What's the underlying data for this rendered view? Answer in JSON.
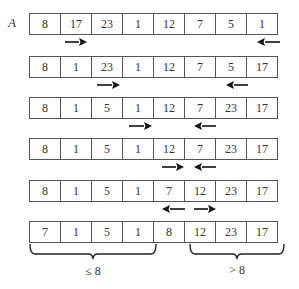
{
  "array_name": "A",
  "steps": [
    {
      "values": [
        "8",
        "17",
        "23",
        "1",
        "12",
        "7",
        "5",
        "1"
      ],
      "arrows": [
        {
          "dir": "right",
          "between": [
            1,
            2
          ]
        },
        {
          "dir": "left",
          "between": [
            7,
            8
          ]
        }
      ]
    },
    {
      "values": [
        "8",
        "1",
        "23",
        "1",
        "12",
        "7",
        "5",
        "17"
      ],
      "arrows": [
        {
          "dir": "right",
          "between": [
            2,
            3
          ]
        },
        {
          "dir": "left",
          "between": [
            6,
            7
          ]
        }
      ]
    },
    {
      "values": [
        "8",
        "1",
        "5",
        "1",
        "12",
        "7",
        "23",
        "17"
      ],
      "arrows": [
        {
          "dir": "right",
          "between": [
            3,
            4
          ]
        },
        {
          "dir": "left",
          "between": [
            5,
            6
          ]
        }
      ]
    },
    {
      "values": [
        "8",
        "1",
        "5",
        "1",
        "12",
        "7",
        "23",
        "17"
      ],
      "arrows": [
        {
          "dir": "right",
          "between": [
            4,
            5
          ]
        },
        {
          "dir": "left",
          "between": [
            5,
            6
          ]
        }
      ]
    },
    {
      "values": [
        "8",
        "1",
        "5",
        "1",
        "7",
        "12",
        "23",
        "17"
      ],
      "arrows": [
        {
          "dir": "left",
          "between": [
            4,
            5
          ]
        },
        {
          "dir": "right",
          "between": [
            5,
            6
          ]
        }
      ]
    },
    {
      "values": [
        "7",
        "1",
        "5",
        "1",
        "8",
        "12",
        "23",
        "17"
      ],
      "arrows": []
    }
  ],
  "partitions": [
    {
      "label": "≤ 8",
      "from_index": 0,
      "to_index": 3
    },
    {
      "label": "> 8",
      "from_index": 5,
      "to_index": 7
    }
  ],
  "colors": {
    "border": "#555555",
    "arrow": "#111111",
    "text": "#333333"
  }
}
